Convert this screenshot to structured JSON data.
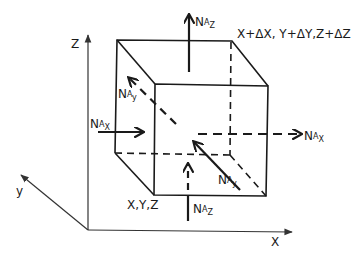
{
  "figure": {
    "type": "control-volume cube with molar flux vectors",
    "axes": {
      "x": "X",
      "y": "y",
      "z": "Z"
    },
    "corners": {
      "origin_corner": "X,Y,Z",
      "far_corner": "X+ΔX, Y+ΔY,Z+ΔZ"
    },
    "fluxes": [
      {
        "id": "nax_in",
        "base": "N",
        "sub1": "A",
        "sub2": "X",
        "direction": "in",
        "style": "solid"
      },
      {
        "id": "nax_out",
        "base": "N",
        "sub1": "A",
        "sub2": "X",
        "direction": "out",
        "style": "dashed"
      },
      {
        "id": "nay_in",
        "base": "N",
        "sub1": "A",
        "sub2": "y",
        "direction": "in",
        "style": "solid"
      },
      {
        "id": "nay_out",
        "base": "N",
        "sub1": "A",
        "sub2": "y",
        "direction": "out",
        "style": "dashed"
      },
      {
        "id": "naz_in",
        "base": "N",
        "sub1": "A",
        "sub2": "Z",
        "direction": "in",
        "style": "dashed"
      },
      {
        "id": "naz_out",
        "base": "N",
        "sub1": "A",
        "sub2": "Z",
        "direction": "out",
        "style": "solid"
      }
    ],
    "colors": {
      "ink": "#1a1a1a",
      "background": "#ffffff"
    }
  }
}
